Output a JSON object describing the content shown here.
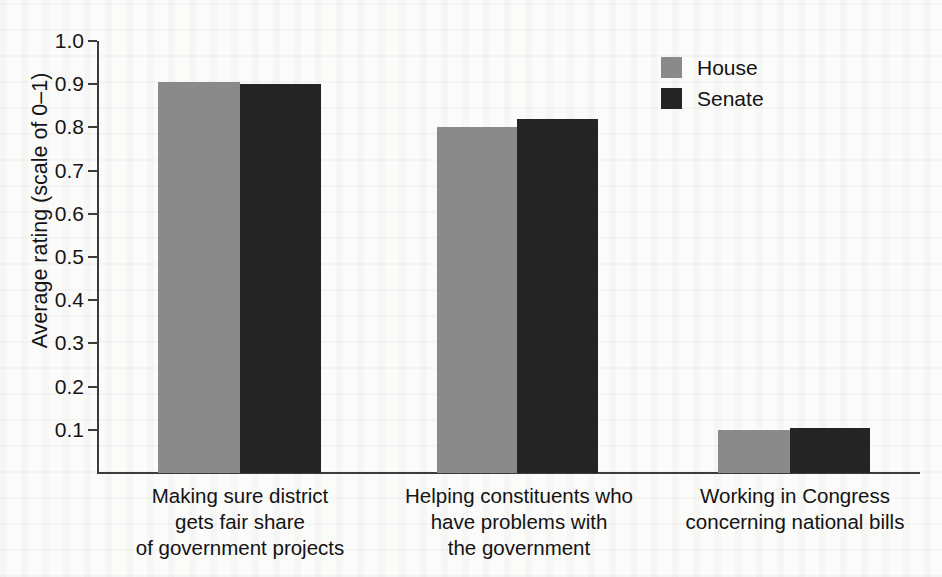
{
  "chart_data": {
    "type": "bar",
    "title": "",
    "subtitle": "",
    "xlabel": "",
    "ylabel": "Average rating (scale of 0–1)",
    "ylim": [
      0,
      1.0
    ],
    "ytick_labels": [
      "0.1",
      "0.2",
      "0.3",
      "0.4",
      "0.5",
      "0.6",
      "0.7",
      "0.8",
      "0.9",
      "1.0"
    ],
    "ytick_values": [
      0.1,
      0.2,
      0.3,
      0.4,
      0.5,
      0.6,
      0.7,
      0.8,
      0.9,
      1.0
    ],
    "grid": false,
    "legend_position": "top-right",
    "categories": [
      "Making sure district\ngets fair share\nof government projects",
      "Helping constituents who\nhave problems with\nthe government",
      "Working in Congress\nconcerning national bills"
    ],
    "category_lines": [
      [
        "Making sure district",
        "gets fair share",
        "of government projects"
      ],
      [
        "Helping constituents who",
        "have problems with",
        "the government"
      ],
      [
        "Working in Congress",
        "concerning national bills"
      ]
    ],
    "series": [
      {
        "name": "House",
        "color": "#8a8a8a",
        "values": [
          0.905,
          0.8,
          0.1
        ]
      },
      {
        "name": "Senate",
        "color": "#242424",
        "values": [
          0.9,
          0.82,
          0.105
        ]
      }
    ]
  },
  "legend": {
    "items": [
      {
        "label": "House",
        "color": "#8a8a8a"
      },
      {
        "label": "Senate",
        "color": "#242424"
      }
    ]
  },
  "axis": {
    "y_label": "Average rating (scale of 0–1)",
    "ticks": [
      "1.0",
      "0.9",
      "0.8",
      "0.7",
      "0.6",
      "0.5",
      "0.4",
      "0.3",
      "0.2",
      "0.1"
    ]
  }
}
